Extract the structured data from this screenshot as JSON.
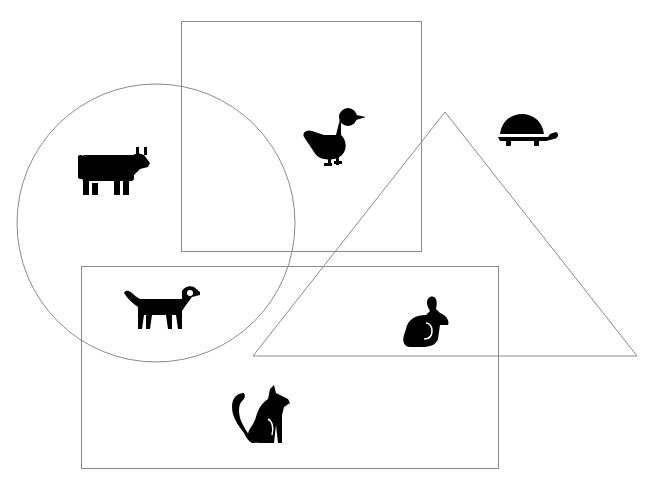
{
  "diagram": {
    "type": "venn-like shape grouping",
    "shapes": [
      {
        "id": "rect-top",
        "kind": "rectangle",
        "x": 181,
        "y": 21,
        "width": 240,
        "height": 230,
        "stroke": "#8a8a8a"
      },
      {
        "id": "rect-bottom",
        "kind": "rectangle",
        "x": 81,
        "y": 266,
        "width": 417,
        "height": 202,
        "stroke": "#8a8a8a"
      },
      {
        "id": "circle",
        "kind": "circle",
        "cx": 156,
        "cy": 223,
        "r": 139,
        "stroke": "#8a8a8a"
      },
      {
        "id": "triangle",
        "kind": "triangle",
        "points": "445,112 253,356 637,356",
        "stroke": "#8a8a8a"
      }
    ],
    "animals": [
      {
        "name": "cow",
        "icon": "cow-icon",
        "x": 113,
        "y": 170,
        "in_shapes": [
          "circle"
        ]
      },
      {
        "name": "duck",
        "icon": "duck-icon",
        "x": 333,
        "y": 135,
        "in_shapes": [
          "rect-top"
        ]
      },
      {
        "name": "turtle",
        "icon": "turtle-icon",
        "x": 527,
        "y": 130,
        "in_shapes": []
      },
      {
        "name": "dog",
        "icon": "dog-icon",
        "x": 162,
        "y": 306,
        "in_shapes": [
          "circle",
          "rect-bottom"
        ]
      },
      {
        "name": "rabbit",
        "icon": "rabbit-icon",
        "x": 429,
        "y": 320,
        "in_shapes": [
          "triangle",
          "rect-bottom"
        ]
      },
      {
        "name": "cat",
        "icon": "cat-icon",
        "x": 262,
        "y": 415,
        "in_shapes": [
          "rect-bottom"
        ]
      }
    ]
  }
}
